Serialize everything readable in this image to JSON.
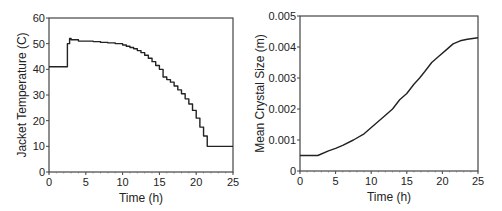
{
  "chart_data": [
    {
      "type": "line",
      "step": true,
      "title": "",
      "xlabel": "Time (h)",
      "ylabel": "Jacket Temperature (C)",
      "xlim": [
        0,
        25
      ],
      "ylim": [
        0,
        60
      ],
      "xticks": [
        0,
        5,
        10,
        15,
        20,
        25
      ],
      "yticks": [
        0,
        10,
        20,
        30,
        40,
        50,
        60
      ],
      "grid": false,
      "legend": null,
      "x": [
        0,
        2.5,
        2.8,
        3.0,
        4.0,
        5.0,
        6.0,
        7.0,
        8.0,
        9.0,
        10.0,
        10.5,
        11.0,
        11.5,
        12.0,
        12.5,
        13.0,
        13.5,
        14.0,
        14.5,
        15.0,
        15.5,
        16.0,
        16.5,
        17.0,
        17.5,
        18.0,
        18.5,
        19.0,
        19.5,
        20.0,
        20.5,
        21.0,
        21.5,
        25.0
      ],
      "values": [
        41,
        50,
        52,
        51.5,
        51,
        51,
        50.8,
        50.5,
        50.3,
        50,
        49.5,
        49,
        48.5,
        48,
        47.3,
        46.5,
        45.5,
        44.3,
        43,
        41.5,
        40,
        37,
        36,
        35,
        33.5,
        32,
        30.5,
        28.5,
        26.5,
        24,
        21,
        17.5,
        14,
        10,
        10
      ]
    },
    {
      "type": "line",
      "title": "",
      "xlabel": "Time (h)",
      "ylabel": "Mean Crystal Size (m)",
      "xlim": [
        0,
        25
      ],
      "ylim": [
        0,
        0.005
      ],
      "xticks": [
        0,
        5,
        10,
        15,
        20,
        25
      ],
      "yticks": [
        "0",
        "0.001",
        "0.002",
        "0.003",
        "0.004",
        "0.005"
      ],
      "grid": false,
      "legend": null,
      "x": [
        0,
        2.5,
        4,
        5,
        6,
        7.5,
        9,
        10.5,
        12,
        13,
        14,
        15,
        16,
        16.8,
        17.5,
        18.5,
        19.5,
        20.5,
        21.5,
        22.5,
        23.5,
        25
      ],
      "values": [
        0.0005,
        0.0005,
        0.00065,
        0.00073,
        0.00083,
        0.001,
        0.0012,
        0.0015,
        0.0018,
        0.002,
        0.0023,
        0.0025,
        0.0028,
        0.003,
        0.0032,
        0.0035,
        0.0037,
        0.0039,
        0.0041,
        0.0042,
        0.00425,
        0.0043
      ]
    }
  ]
}
